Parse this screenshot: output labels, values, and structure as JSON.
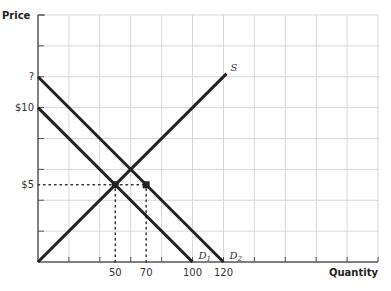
{
  "chart_data": {
    "type": "line",
    "title": "",
    "xlabel": "Quantity",
    "ylabel": "Price",
    "xlim": [
      0,
      220
    ],
    "ylim": [
      0,
      16
    ],
    "grid": true,
    "x_gridstep": 20,
    "y_gridstep": 2,
    "x_tick_labels": [
      {
        "value": 50,
        "label": "50"
      },
      {
        "value": 70,
        "label": "70"
      },
      {
        "value": 100,
        "label": "100"
      },
      {
        "value": 120,
        "label": "120"
      }
    ],
    "y_tick_labels": [
      {
        "value": 12,
        "label": "?"
      },
      {
        "value": 10,
        "label": "$10"
      },
      {
        "value": 5,
        "label": "$5"
      }
    ],
    "series": [
      {
        "name": "S",
        "label": "S",
        "points": [
          [
            0,
            0
          ],
          [
            122,
            12.2
          ]
        ]
      },
      {
        "name": "D1",
        "label": "D",
        "sub": "1",
        "points": [
          [
            0,
            10
          ],
          [
            100,
            0
          ]
        ]
      },
      {
        "name": "D2",
        "label": "D",
        "sub": "2",
        "points": [
          [
            0,
            12
          ],
          [
            120,
            0
          ]
        ]
      }
    ],
    "markers": [
      {
        "name": "equilibrium",
        "x": 50,
        "y": 5,
        "shape": "circle"
      },
      {
        "name": "new-quantity-demanded",
        "x": 70,
        "y": 5,
        "shape": "square"
      }
    ],
    "guides": [
      {
        "from": [
          0,
          5
        ],
        "to": [
          70,
          5
        ]
      },
      {
        "from": [
          50,
          0
        ],
        "to": [
          50,
          5
        ]
      },
      {
        "from": [
          70,
          0
        ],
        "to": [
          70,
          5
        ]
      }
    ]
  }
}
